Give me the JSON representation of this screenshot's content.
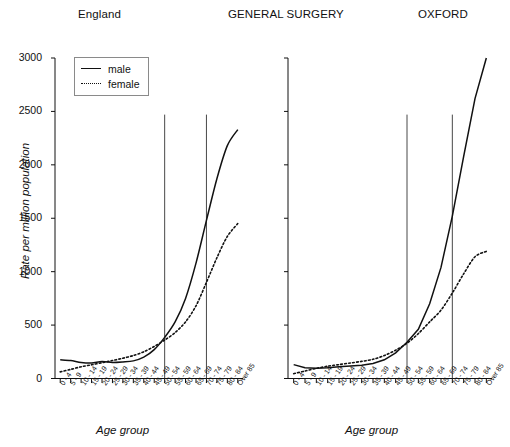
{
  "titles": {
    "left": "England",
    "center": "GENERAL SURGERY",
    "right": "OXFORD"
  },
  "axis": {
    "ylabel": "Rate per million population",
    "xlabel": "Age group",
    "yticks": [
      "0",
      "500",
      "1000",
      "1500",
      "2000",
      "2500",
      "3000"
    ]
  },
  "legend": {
    "male_label": "male",
    "female_label": "female"
  },
  "chart_data": [
    {
      "type": "line",
      "title": "England",
      "xlabel": "Age group",
      "ylabel": "Rate per million population",
      "ylim": [
        0,
        3000
      ],
      "yticks": [
        0,
        500,
        1000,
        1500,
        2000,
        2500,
        3000
      ],
      "grid": false,
      "legend_position": "top-left",
      "categories": [
        "0 - 4",
        "5 - 9",
        "10 - 14",
        "15 - 19",
        "20 - 24",
        "25 - 29",
        "30 - 34",
        "35 - 39",
        "40 - 44",
        "45 - 49",
        "50 - 54",
        "55 - 59",
        "60 - 64",
        "65 - 69",
        "70 - 74",
        "75 - 79",
        "80 - 84",
        "Over 85"
      ],
      "series": [
        {
          "name": "male",
          "style": "solid",
          "values": [
            175,
            168,
            150,
            145,
            158,
            150,
            155,
            165,
            200,
            270,
            385,
            530,
            750,
            1080,
            1480,
            1870,
            2180,
            2330
          ]
        },
        {
          "name": "female",
          "style": "dotted",
          "values": [
            62,
            85,
            110,
            128,
            148,
            168,
            190,
            215,
            250,
            300,
            360,
            430,
            530,
            680,
            900,
            1130,
            1330,
            1450
          ]
        }
      ],
      "reference_lines": [
        {
          "at_category": "50 - 54",
          "orientation": "vertical",
          "y_top": 2470
        },
        {
          "at_category": "70 - 74",
          "orientation": "vertical",
          "y_top": 2470
        }
      ]
    },
    {
      "type": "line",
      "title": "OXFORD",
      "xlabel": "Age group",
      "ylabel": "Rate per million population",
      "ylim": [
        0,
        3000
      ],
      "yticks": [
        0,
        500,
        1000,
        1500,
        2000,
        2500,
        3000
      ],
      "grid": false,
      "legend_position": "none",
      "categories": [
        "0 - 4",
        "5 - 9",
        "10 - 14",
        "15 - 19",
        "20 - 24",
        "25 - 29",
        "30 - 34",
        "35 - 39",
        "40 - 44",
        "45 - 49",
        "50 - 54",
        "55 - 59",
        "60 - 64",
        "65 - 69",
        "70 - 74",
        "75 - 79",
        "80 - 84",
        "Over 85"
      ],
      "series": [
        {
          "name": "male",
          "style": "solid",
          "values": [
            130,
            100,
            95,
            100,
            110,
            118,
            125,
            140,
            175,
            240,
            340,
            460,
            700,
            1040,
            1520,
            2080,
            2620,
            3000
          ]
        },
        {
          "name": "female",
          "style": "dotted",
          "values": [
            45,
            70,
            95,
            115,
            130,
            145,
            160,
            180,
            215,
            265,
            330,
            420,
            530,
            640,
            800,
            980,
            1140,
            1190
          ]
        }
      ],
      "reference_lines": [
        {
          "at_category": "50 - 54",
          "orientation": "vertical",
          "y_top": 2470
        },
        {
          "at_category": "70 - 74",
          "orientation": "vertical",
          "y_top": 2470
        }
      ]
    }
  ]
}
